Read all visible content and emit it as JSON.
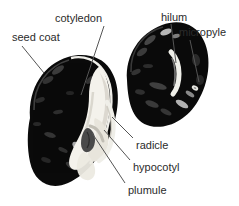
{
  "figure": {
    "type": "labeled-botanical-diagram",
    "background_color": "#ffffff",
    "text_color": "#2b2b2b",
    "seed_dark_color": "#0b0b0b",
    "cotyledon_color": "#f2f0ea",
    "embryo_color": "#d8d5cc",
    "leader_line_color": "#555555"
  },
  "labels": [
    {
      "id": "seed-coat",
      "text": "seed coat",
      "x": 12,
      "y": 31,
      "leader": {
        "x1": 22,
        "y1": 46,
        "x2": 44,
        "y2": 73
      }
    },
    {
      "id": "cotyledon",
      "text": "cotyledon",
      "x": 55,
      "y": 12,
      "leader": {
        "x1": 104,
        "y1": 26,
        "x2": 81,
        "y2": 95
      }
    },
    {
      "id": "hilum",
      "text": "hilum",
      "x": 161,
      "y": 11,
      "leader": {
        "x1": 171,
        "y1": 24,
        "x2": 176,
        "y2": 63
      }
    },
    {
      "id": "micropyle",
      "text": "micropyle",
      "x": 179,
      "y": 26,
      "leader": {
        "x1": 190,
        "y1": 40,
        "x2": 199,
        "y2": 82
      }
    },
    {
      "id": "radicle",
      "text": "radicle",
      "x": 136,
      "y": 139,
      "leader": {
        "x1": 133,
        "y1": 138,
        "x2": 112,
        "y2": 117
      }
    },
    {
      "id": "hypocotyl",
      "text": "hypocotyl",
      "x": 133,
      "y": 161,
      "leader": {
        "x1": 130,
        "y1": 160,
        "x2": 104,
        "y2": 130
      }
    },
    {
      "id": "plumule",
      "text": "plumule",
      "x": 128,
      "y": 184,
      "leader": {
        "x1": 125,
        "y1": 183,
        "x2": 92,
        "y2": 133
      }
    }
  ],
  "shapes": {
    "left_seed": {
      "name": "dissected-bean-seed",
      "bbox": [
        26,
        54,
        120,
        188
      ]
    },
    "right_seed": {
      "name": "whole-bean-seed",
      "bbox": [
        123,
        21,
        210,
        127
      ]
    }
  }
}
